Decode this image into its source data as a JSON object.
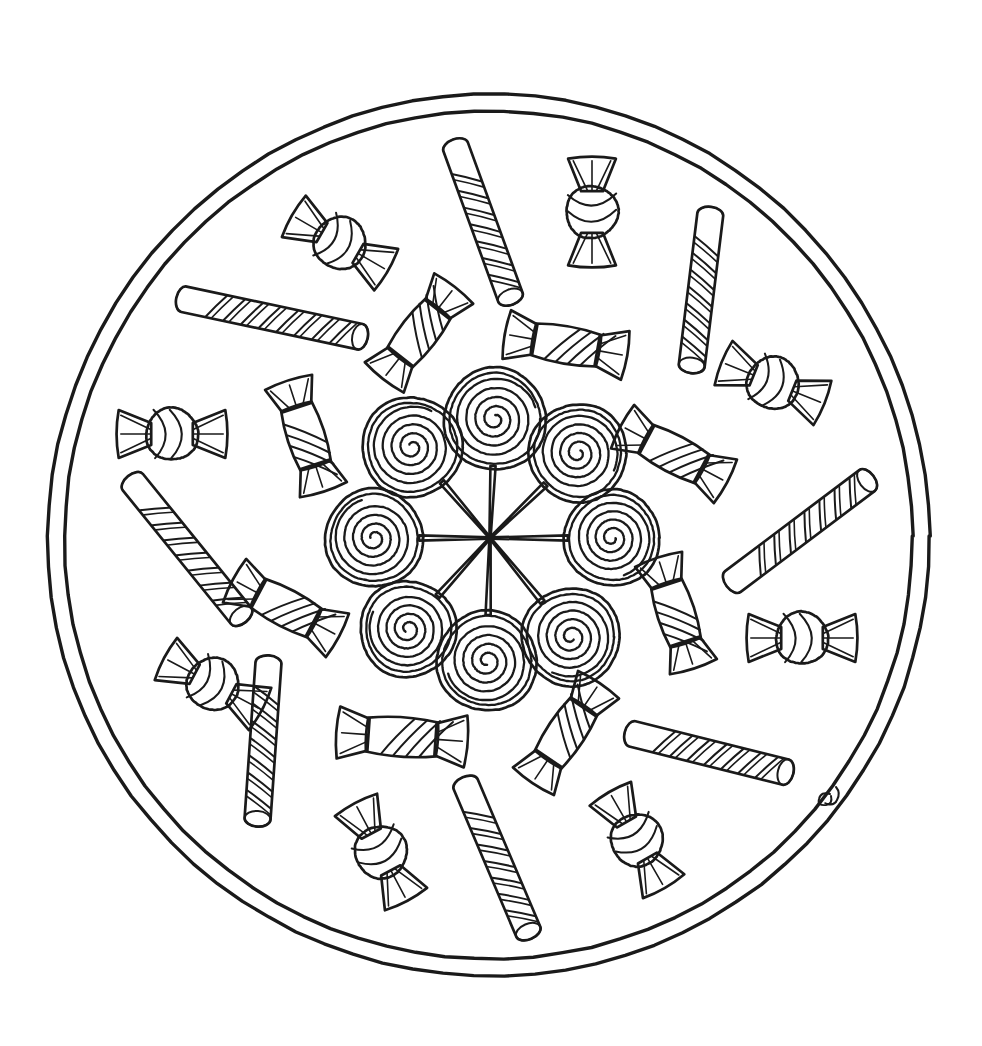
{
  "page": {
    "kind": "line-art-coloring-page",
    "width": 982,
    "height": 1046,
    "background_color": "#ffffff",
    "ink_color": "#1a1a1a"
  },
  "frame": {
    "center_x": 489,
    "center_y": 536,
    "outer_radius": 441,
    "inner_radius": 424,
    "ring_count": 2
  },
  "hub": {
    "center_x": 490,
    "center_y": 538,
    "spoke_count": 8,
    "label": "lollipop-hub"
  },
  "lollipops": [
    {
      "name": "lollipop-n",
      "cx": 495,
      "cy": 419,
      "r": 51,
      "turns": 4.2,
      "angle_deg": -88
    },
    {
      "name": "lollipop-ne",
      "cx": 578,
      "cy": 453,
      "r": 49,
      "turns": 4.2,
      "angle_deg": -46
    },
    {
      "name": "lollipop-e",
      "cx": 612,
      "cy": 538,
      "r": 48,
      "turns": 4.2,
      "angle_deg": 0
    },
    {
      "name": "lollipop-se",
      "cx": 571,
      "cy": 637,
      "r": 49,
      "turns": 4.2,
      "angle_deg": 46
    },
    {
      "name": "lollipop-s",
      "cx": 487,
      "cy": 661,
      "r": 50,
      "turns": 4.2,
      "angle_deg": 90
    },
    {
      "name": "lollipop-sw",
      "cx": 408,
      "cy": 629,
      "r": 48,
      "turns": 4.2,
      "angle_deg": 134
    },
    {
      "name": "lollipop-w",
      "cx": 374,
      "cy": 538,
      "r": 49,
      "turns": 4.2,
      "angle_deg": 180
    },
    {
      "name": "lollipop-nw",
      "cx": 412,
      "cy": 447,
      "r": 50,
      "turns": 4.2,
      "angle_deg": -134
    }
  ],
  "candy_sticks": [
    {
      "name": "candy-stick-top",
      "cx": 483,
      "cy": 222,
      "length": 160,
      "thickness": 26,
      "angle_deg": 70,
      "stripes": 7
    },
    {
      "name": "candy-stick-upper-right",
      "cx": 701,
      "cy": 290,
      "length": 152,
      "thickness": 26,
      "angle_deg": 97,
      "stripes": 7
    },
    {
      "name": "candy-stick-upper-left",
      "cx": 272,
      "cy": 318,
      "length": 180,
      "thickness": 26,
      "angle_deg": 12,
      "stripes": 8
    },
    {
      "name": "candy-stick-left",
      "cx": 187,
      "cy": 549,
      "length": 172,
      "thickness": 26,
      "angle_deg": 51,
      "stripes": 7
    },
    {
      "name": "candy-stick-right",
      "cx": 800,
      "cy": 531,
      "length": 168,
      "thickness": 26,
      "angle_deg": -37,
      "stripes": 7
    },
    {
      "name": "candy-stick-lower-left",
      "cx": 263,
      "cy": 741,
      "length": 156,
      "thickness": 26,
      "angle_deg": 94,
      "stripes": 7
    },
    {
      "name": "candy-stick-lower-right",
      "cx": 709,
      "cy": 753,
      "length": 158,
      "thickness": 26,
      "angle_deg": 14,
      "stripes": 7
    },
    {
      "name": "candy-stick-bottom",
      "cx": 497,
      "cy": 858,
      "length": 160,
      "thickness": 26,
      "angle_deg": 67,
      "stripes": 7
    }
  ],
  "round_candies": [
    {
      "name": "round-candy-top-left",
      "cx": 340,
      "cy": 243,
      "r": 26,
      "angle_deg": 30,
      "stripes": 2
    },
    {
      "name": "round-candy-top-right",
      "cx": 592,
      "cy": 212,
      "r": 26,
      "angle_deg": 90,
      "stripes": 2
    },
    {
      "name": "round-candy-left",
      "cx": 172,
      "cy": 434,
      "r": 26,
      "angle_deg": 0,
      "stripes": 2
    },
    {
      "name": "round-candy-upper-right",
      "cx": 773,
      "cy": 383,
      "r": 26,
      "angle_deg": 22,
      "stripes": 2
    },
    {
      "name": "round-candy-lower-left",
      "cx": 213,
      "cy": 684,
      "r": 26,
      "angle_deg": 28,
      "stripes": 2
    },
    {
      "name": "round-candy-right",
      "cx": 802,
      "cy": 638,
      "r": 26,
      "angle_deg": 0,
      "stripes": 2
    },
    {
      "name": "round-candy-bottom-left",
      "cx": 381,
      "cy": 852,
      "r": 26,
      "angle_deg": 62,
      "stripes": 2
    },
    {
      "name": "round-candy-bottom-right",
      "cx": 637,
      "cy": 840,
      "r": 26,
      "angle_deg": 60,
      "stripes": 2
    }
  ],
  "wrapped_candies": [
    {
      "name": "wrapped-candy-top-inner",
      "cx": 419,
      "cy": 333,
      "w": 62,
      "h": 38,
      "angle_deg": -52,
      "stripes": 4
    },
    {
      "name": "wrapped-candy-top-inner-right",
      "cx": 566,
      "cy": 345,
      "w": 66,
      "h": 38,
      "angle_deg": 10,
      "stripes": 4
    },
    {
      "name": "wrapped-candy-upper-left",
      "cx": 306,
      "cy": 436,
      "w": 62,
      "h": 38,
      "angle_deg": 72,
      "stripes": 4
    },
    {
      "name": "wrapped-candy-upper-right",
      "cx": 674,
      "cy": 454,
      "w": 64,
      "h": 38,
      "angle_deg": 28,
      "stripes": 4
    },
    {
      "name": "wrapped-candy-mid-right",
      "cx": 676,
      "cy": 613,
      "w": 62,
      "h": 38,
      "angle_deg": 72,
      "stripes": 4
    },
    {
      "name": "wrapped-candy-mid-left",
      "cx": 286,
      "cy": 608,
      "w": 64,
      "h": 38,
      "angle_deg": 28,
      "stripes": 4
    },
    {
      "name": "wrapped-candy-bottom-left",
      "cx": 402,
      "cy": 737,
      "w": 70,
      "h": 40,
      "angle_deg": 4,
      "stripes": 4
    },
    {
      "name": "wrapped-candy-bottom-right",
      "cx": 566,
      "cy": 733,
      "w": 64,
      "h": 38,
      "angle_deg": -56,
      "stripes": 4
    }
  ],
  "signature": {
    "name": "artist-signature",
    "x": 824,
    "y": 798,
    "present": true
  }
}
